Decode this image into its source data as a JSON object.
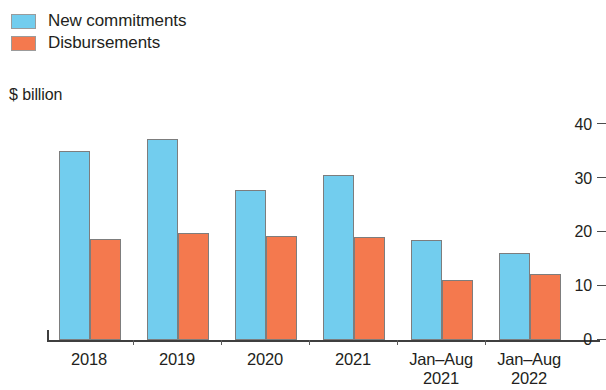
{
  "chart_data": {
    "type": "bar",
    "title": "",
    "subtitle": "",
    "xlabel": "",
    "ylabel": "$ billion",
    "ylim": [
      0,
      40
    ],
    "yticks": [
      0,
      10,
      20,
      30,
      40
    ],
    "ytick_labels": [
      "0",
      "10",
      "20",
      "30",
      "40"
    ],
    "grid": false,
    "legend_position": "top-left",
    "categories": [
      "2018",
      "2019",
      "2020",
      "2021",
      "Jan–Aug\n2021",
      "Jan–Aug\n2022"
    ],
    "series": [
      {
        "name": "New commitments",
        "color": "#72cdee",
        "values": [
          35.1,
          37.3,
          27.9,
          30.6,
          18.5,
          16.2
        ]
      },
      {
        "name": "Disbursements",
        "color": "#f4794e",
        "values": [
          18.7,
          19.9,
          19.4,
          19.1,
          11.2,
          12.3
        ]
      }
    ]
  },
  "legend": {
    "items": [
      {
        "label": "New commitments",
        "color": "#72cdee"
      },
      {
        "label": "Disbursements",
        "color": "#f4794e"
      }
    ]
  },
  "axis": {
    "unit_caption": "$ billion",
    "y_labels": [
      "40",
      "30",
      "20",
      "10",
      "0"
    ]
  },
  "x_labels": [
    {
      "line1": "2018",
      "line2": ""
    },
    {
      "line1": "2019",
      "line2": ""
    },
    {
      "line1": "2020",
      "line2": ""
    },
    {
      "line1": "2021",
      "line2": ""
    },
    {
      "line1": "Jan–Aug",
      "line2": "2021"
    },
    {
      "line1": "Jan–Aug",
      "line2": "2022"
    }
  ],
  "colors": {
    "series_1": "#72cdee",
    "series_2": "#f4794e",
    "axis": "#3f3f3f",
    "text": "#231f20",
    "background": "#ffffff"
  }
}
